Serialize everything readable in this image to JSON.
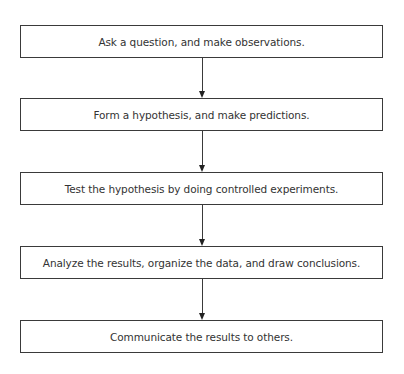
{
  "diagram": {
    "type": "flowchart",
    "direction": "top-to-bottom",
    "steps": [
      {
        "label": "Ask a question, and make observations."
      },
      {
        "label": "Form a hypothesis, and make predictions."
      },
      {
        "label": "Test the hypothesis by doing controlled experiments."
      },
      {
        "label": "Analyze the results, organize the data, and draw conclusions."
      },
      {
        "label": "Communicate the results to others."
      }
    ],
    "connectors": [
      {
        "from": 0,
        "to": 1
      },
      {
        "from": 1,
        "to": 2
      },
      {
        "from": 2,
        "to": 3
      },
      {
        "from": 3,
        "to": 4
      }
    ],
    "colors": {
      "border": "#3a3a3a",
      "text": "#333333",
      "background": "#ffffff"
    }
  }
}
